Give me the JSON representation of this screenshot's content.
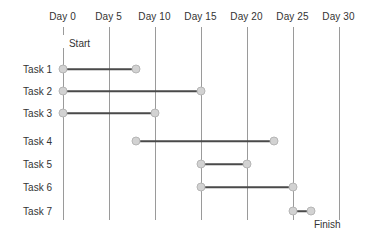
{
  "chart_data": {
    "type": "bar",
    "chart_kind": "gantt",
    "title": "",
    "xlabel": "",
    "ylabel": "",
    "xlim": [
      0,
      30
    ],
    "grid": true,
    "legend": "none",
    "axis": {
      "tick_values": [
        0,
        5,
        10,
        15,
        20,
        25,
        30
      ],
      "tick_labels": [
        "Day 0",
        "Day 5",
        "Day 10",
        "Day 15",
        "Day 20",
        "Day 25",
        "Day 30"
      ],
      "position": "top"
    },
    "milestones": [
      {
        "name": "start",
        "label": "Start",
        "day": 0
      },
      {
        "name": "finish",
        "label": "Finish",
        "day": 27
      }
    ],
    "categories": [
      "Task 1",
      "Task 2",
      "Task 3",
      "Task 4",
      "Task 5",
      "Task 6",
      "Task 7"
    ],
    "tasks": [
      {
        "label": "Task 1",
        "start": 0,
        "end": 8,
        "duration": 8
      },
      {
        "label": "Task 2",
        "start": 0,
        "end": 15,
        "duration": 15
      },
      {
        "label": "Task 3",
        "start": 0,
        "end": 10,
        "duration": 10
      },
      {
        "label": "Task 4",
        "start": 8,
        "end": 23,
        "duration": 15
      },
      {
        "label": "Task 5",
        "start": 15,
        "end": 20,
        "duration": 5
      },
      {
        "label": "Task 6",
        "start": 15,
        "end": 25,
        "duration": 10
      },
      {
        "label": "Task 7",
        "start": 25,
        "end": 27,
        "duration": 2
      }
    ]
  },
  "colors": {
    "marker_fill": "#d2d2d2",
    "marker_stroke": "#b6b6b6",
    "bar_line": "#4a4a4a",
    "gridline": "#9a9a9a",
    "text": "#333333",
    "background": "#ffffff"
  }
}
